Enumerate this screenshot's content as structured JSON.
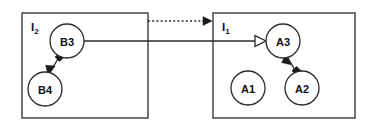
{
  "canvas": {
    "width": 372,
    "height": 126,
    "background": "#ffffff"
  },
  "style": {
    "stroke_color": "#2b2b2b",
    "box_stroke_color": "#3a3a3a",
    "fill_color": "#ffffff",
    "text_color": "#111111"
  },
  "diagram": {
    "type": "uml-object-diagram",
    "containers": [
      {
        "id": "container-i2",
        "label_base": "I",
        "label_sub": "2",
        "x": 22,
        "y": 13,
        "width": 126,
        "height": 105
      },
      {
        "id": "container-i1",
        "label_base": "I",
        "label_sub": "1",
        "x": 213,
        "y": 13,
        "width": 142,
        "height": 105
      }
    ],
    "nodes": [
      {
        "id": "node-b3",
        "label": "B3",
        "cx": 67,
        "cy": 41,
        "r": 17,
        "container": "container-i2"
      },
      {
        "id": "node-b4",
        "label": "B4",
        "cx": 45,
        "cy": 89,
        "r": 17,
        "container": "container-i2"
      },
      {
        "id": "node-a3",
        "label": "A3",
        "cx": 283,
        "cy": 41,
        "r": 17,
        "container": "container-i1"
      },
      {
        "id": "node-a1",
        "label": "A1",
        "cx": 248,
        "cy": 88,
        "r": 17,
        "container": "container-i1"
      },
      {
        "id": "node-a2",
        "label": "A2",
        "cx": 302,
        "cy": 88,
        "r": 17,
        "container": "container-i1"
      }
    ],
    "edges": [
      {
        "id": "edge-b3-b4",
        "from": "node-b3",
        "to": "node-b4",
        "line_style": "solid",
        "source_decoration": "filled-diamond",
        "target_decoration": "filled-arrowhead"
      },
      {
        "id": "edge-a2-a3",
        "from": "node-a2",
        "to": "node-a3",
        "line_style": "solid",
        "source_decoration": "filled-diamond",
        "target_decoration": "filled-arrowhead"
      },
      {
        "id": "edge-b3-a3",
        "from": "node-b3",
        "to": "node-a3",
        "line_style": "solid",
        "source_decoration": "none",
        "target_decoration": "open-arrowhead"
      },
      {
        "id": "edge-i2-i1",
        "from": "container-i2",
        "to": "container-i1",
        "line_style": "dotted",
        "source_decoration": "none",
        "target_decoration": "filled-arrowhead"
      }
    ]
  }
}
